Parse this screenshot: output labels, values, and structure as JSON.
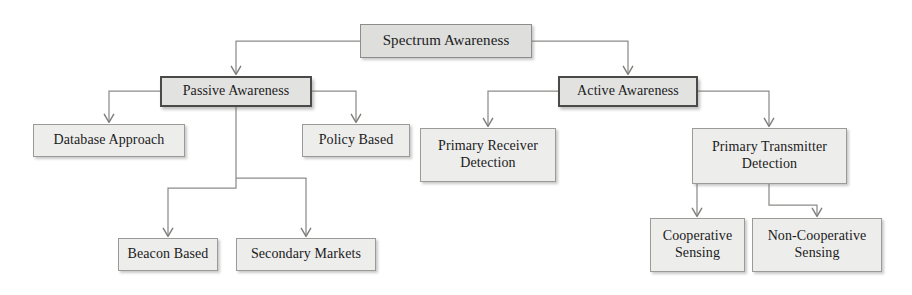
{
  "diagram": {
    "type": "hierarchy-tree",
    "title": "Spectrum Awareness",
    "orientation": "top-down",
    "colors": {
      "root_fill": "#dededd",
      "branch_fill": "#e2e2e1",
      "leaf_fill": "#ededec",
      "branch_border": "#4a4a49",
      "leaf_border": "#9a9a98",
      "edge_stroke": "#8c8c8a",
      "text": "#1b1b1b",
      "background": "#ffffff"
    },
    "nodes": [
      {
        "id": "spectrum-awareness",
        "label": "Spectrum Awareness",
        "level": "root",
        "x": 360,
        "y": 24,
        "w": 172,
        "h": 34,
        "font_size": 15
      },
      {
        "id": "passive-awareness",
        "label": "Passive Awareness",
        "level": "branch",
        "x": 160,
        "y": 76,
        "w": 152,
        "h": 31,
        "font_size": 14
      },
      {
        "id": "active-awareness",
        "label": "Active Awareness",
        "level": "branch",
        "x": 558,
        "y": 76,
        "w": 140,
        "h": 31,
        "font_size": 14
      },
      {
        "id": "database-approach",
        "label": "Database Approach",
        "level": "leaf",
        "x": 33,
        "y": 124,
        "w": 152,
        "h": 33,
        "font_size": 14
      },
      {
        "id": "policy-based",
        "label": "Policy Based",
        "level": "leaf",
        "x": 302,
        "y": 124,
        "w": 108,
        "h": 33,
        "font_size": 14
      },
      {
        "id": "primary-receiver-detection",
        "label": "Primary Receiver\nDetection",
        "level": "leaf",
        "x": 420,
        "y": 128,
        "w": 136,
        "h": 54,
        "font_size": 14
      },
      {
        "id": "primary-transmitter-detection",
        "label": "Primary Transmitter\nDetection",
        "level": "leaf",
        "x": 692,
        "y": 128,
        "w": 155,
        "h": 56,
        "font_size": 14
      },
      {
        "id": "beacon-based",
        "label": "Beacon Based",
        "level": "leaf",
        "x": 118,
        "y": 238,
        "w": 100,
        "h": 33,
        "font_size": 14
      },
      {
        "id": "secondary-markets",
        "label": "Secondary Markets",
        "level": "leaf",
        "x": 236,
        "y": 238,
        "w": 140,
        "h": 33,
        "font_size": 14
      },
      {
        "id": "cooperative-sensing",
        "label": "Cooperative\nSensing",
        "level": "leaf",
        "x": 650,
        "y": 218,
        "w": 95,
        "h": 54,
        "font_size": 14
      },
      {
        "id": "non-cooperative-sensing",
        "label": "Non-Cooperative\nSensing",
        "level": "leaf",
        "x": 752,
        "y": 218,
        "w": 130,
        "h": 54,
        "font_size": 14
      }
    ],
    "edges": [
      {
        "id": "edge-root-to-passive",
        "from": "spectrum-awareness",
        "to": "passive-awareness"
      },
      {
        "id": "edge-root-to-active",
        "from": "spectrum-awareness",
        "to": "active-awareness"
      },
      {
        "id": "edge-passive-to-database",
        "from": "passive-awareness",
        "to": "database-approach"
      },
      {
        "id": "edge-passive-to-policy",
        "from": "passive-awareness",
        "to": "policy-based"
      },
      {
        "id": "edge-passive-to-beacon",
        "from": "passive-awareness",
        "to": "beacon-based"
      },
      {
        "id": "edge-passive-to-secondary",
        "from": "passive-awareness",
        "to": "secondary-markets"
      },
      {
        "id": "edge-active-to-primary-receiver",
        "from": "active-awareness",
        "to": "primary-receiver-detection"
      },
      {
        "id": "edge-active-to-primary-transmitter",
        "from": "active-awareness",
        "to": "primary-transmitter-detection"
      },
      {
        "id": "edge-transmitter-to-cooperative",
        "from": "primary-transmitter-detection",
        "to": "cooperative-sensing"
      },
      {
        "id": "edge-transmitter-to-non-cooperative",
        "from": "primary-transmitter-detection",
        "to": "non-cooperative-sensing"
      }
    ]
  }
}
